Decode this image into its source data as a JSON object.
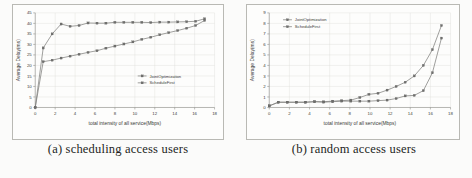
{
  "figure": {
    "panels": [
      {
        "id": "panel-a",
        "caption": "(a) scheduling access users",
        "chart_ref": 0
      },
      {
        "id": "panel-b",
        "caption": "(b) random access users",
        "chart_ref": 1
      }
    ]
  },
  "chart_data": [
    {
      "type": "line",
      "title": "",
      "xlabel": "total intensity of all service(Mbps)",
      "ylabel": "Average Delay(ms)",
      "xlim": [
        0,
        18
      ],
      "ylim": [
        0,
        45
      ],
      "xticks": [
        0,
        2,
        4,
        6,
        8,
        10,
        12,
        14,
        16,
        18
      ],
      "yticks": [
        0,
        5,
        10,
        15,
        20,
        25,
        30,
        35,
        40,
        45
      ],
      "grid": true,
      "legend_position": "lower-right",
      "series": [
        {
          "name": "JointOptimization",
          "x": [
            0,
            0.8,
            1.7,
            2.6,
            3.5,
            4.4,
            5.3,
            6.2,
            7.1,
            8.0,
            8.9,
            9.8,
            10.7,
            11.6,
            12.5,
            13.4,
            14.3,
            15.2,
            16.1,
            17.0
          ],
          "values": [
            0,
            28.3,
            35.0,
            39.7,
            38.6,
            39.0,
            40.2,
            40.1,
            40.1,
            40.5,
            40.5,
            40.5,
            40.5,
            40.4,
            40.6,
            40.6,
            40.7,
            40.8,
            41.0,
            42.2
          ]
        },
        {
          "name": "ScheduleFirst",
          "x": [
            0,
            0.8,
            1.7,
            2.6,
            3.5,
            4.4,
            5.3,
            6.2,
            7.1,
            8.0,
            8.9,
            9.8,
            10.7,
            11.6,
            12.5,
            13.4,
            14.3,
            15.2,
            16.1,
            17.0
          ],
          "values": [
            0,
            21.8,
            22.5,
            23.5,
            24.4,
            25.3,
            26.2,
            27.0,
            28.2,
            29.2,
            30.2,
            31.2,
            32.4,
            33.4,
            34.6,
            35.6,
            36.6,
            37.7,
            39.0,
            41.4
          ]
        }
      ]
    },
    {
      "type": "line",
      "title": "",
      "xlabel": "total intensity of all service(Mbps)",
      "ylabel": "Average Delay(ms)",
      "xlim": [
        0,
        18
      ],
      "ylim": [
        0,
        9
      ],
      "xticks": [
        0,
        2,
        4,
        6,
        8,
        10,
        12,
        14,
        16,
        18
      ],
      "yticks": [
        0,
        1,
        2,
        3,
        4,
        5,
        6,
        7,
        8,
        9
      ],
      "grid": true,
      "legend_position": "upper-left",
      "series": [
        {
          "name": "JointOptimization",
          "x": [
            0,
            0.9,
            1.8,
            2.7,
            3.6,
            4.5,
            5.4,
            6.3,
            7.2,
            8.1,
            9.0,
            9.9,
            10.8,
            11.7,
            12.6,
            13.5,
            14.4,
            15.3,
            16.2,
            17.1
          ],
          "values": [
            0.15,
            0.5,
            0.5,
            0.5,
            0.5,
            0.55,
            0.55,
            0.6,
            0.65,
            0.7,
            0.95,
            1.25,
            1.35,
            1.65,
            2.0,
            2.4,
            3.0,
            4.0,
            5.5,
            7.8
          ]
        },
        {
          "name": "ScheduleFirst",
          "x": [
            0,
            0.9,
            1.8,
            2.7,
            3.6,
            4.5,
            5.4,
            6.3,
            7.2,
            8.1,
            9.0,
            9.9,
            10.8,
            11.7,
            12.6,
            13.5,
            14.4,
            15.3,
            16.2,
            17.1
          ],
          "values": [
            0.15,
            0.5,
            0.5,
            0.5,
            0.5,
            0.55,
            0.5,
            0.55,
            0.6,
            0.6,
            0.6,
            0.6,
            0.65,
            0.7,
            0.85,
            1.1,
            1.15,
            1.6,
            3.3,
            6.6
          ]
        }
      ]
    }
  ],
  "colors": {
    "curve": "#7e7e7c",
    "marker": "#6f6f6d",
    "grid": "#d9d9d4",
    "axis": "#8d8d88",
    "frame": "#b9b9b4",
    "background": "#fbfbfa"
  }
}
